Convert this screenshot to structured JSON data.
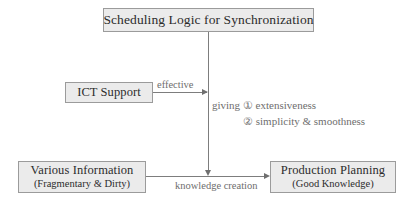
{
  "diagram": {
    "title": "Scheduling Logic for Synchronization",
    "nodes": {
      "scheduling": {
        "label": "Scheduling Logic for Synchronization"
      },
      "ict": {
        "label": "ICT Support"
      },
      "various": {
        "label": "Various Information",
        "sublabel": "(Fragmentary & Dirty)"
      },
      "production": {
        "label": "Production Planning",
        "sublabel": "(Good Knowledge)"
      }
    },
    "edge_labels": {
      "effective": "effective",
      "knowledge_creation": "knowledge creation"
    },
    "annotation": {
      "line1": "giving ① extensiveness",
      "line2": "② simplicity & smoothness"
    },
    "colors": {
      "box_fill": "#ebebeb",
      "box_border": "#9b9b9b",
      "connector": "#7d7d7d",
      "text_primary": "#2b2b2b",
      "text_secondary": "#6e6e6e",
      "background": "#ffffff"
    }
  }
}
